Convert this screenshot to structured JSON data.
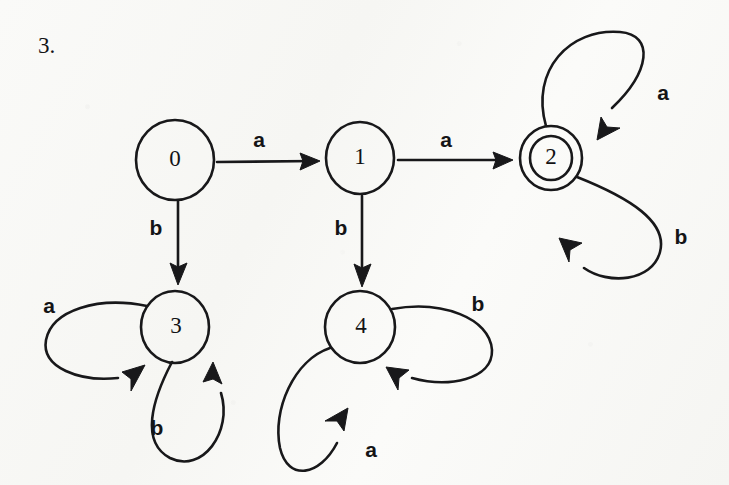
{
  "page": {
    "question_number": "3.",
    "background_color": "#f8f8f6",
    "ink_color": "#18181a"
  },
  "diagram": {
    "type": "finite-state-automaton",
    "alphabet": [
      "a",
      "b"
    ],
    "start_state": "0",
    "accepting_states": [
      "2"
    ],
    "states": [
      {
        "id": "0",
        "label": "0",
        "x": 175,
        "y": 160,
        "r": 38,
        "accepting": false
      },
      {
        "id": "1",
        "label": "1",
        "x": 360,
        "y": 158,
        "r": 34,
        "accepting": false
      },
      {
        "id": "2",
        "label": "2",
        "x": 551,
        "y": 158,
        "r": 31,
        "inner_r": 20,
        "accepting": true
      },
      {
        "id": "3",
        "label": "3",
        "x": 175,
        "y": 327,
        "r": 34,
        "accepting": false
      },
      {
        "id": "4",
        "label": "4",
        "x": 360,
        "y": 327,
        "r": 34,
        "accepting": false
      }
    ],
    "transitions": [
      {
        "from": "0",
        "to": "1",
        "label": "a",
        "label_x": 259,
        "label_y": 141,
        "kind": "straight"
      },
      {
        "from": "1",
        "to": "2",
        "label": "a",
        "label_x": 446,
        "label_y": 141,
        "kind": "straight"
      },
      {
        "from": "0",
        "to": "3",
        "label": "b",
        "label_x": 156,
        "label_y": 229,
        "kind": "straight"
      },
      {
        "from": "1",
        "to": "4",
        "label": "b",
        "label_x": 341,
        "label_y": 229,
        "kind": "straight"
      },
      {
        "from": "2",
        "to": "2",
        "label": "a",
        "label_x": 663,
        "label_y": 94,
        "kind": "self-loop"
      },
      {
        "from": "2",
        "to": "2",
        "label": "b",
        "label_x": 681,
        "label_y": 238,
        "kind": "self-loop"
      },
      {
        "from": "3",
        "to": "3",
        "label": "a",
        "label_x": 49,
        "label_y": 307,
        "kind": "self-loop"
      },
      {
        "from": "3",
        "to": "3",
        "label": "b",
        "label_x": 157,
        "label_y": 429,
        "kind": "self-loop"
      },
      {
        "from": "4",
        "to": "4",
        "label": "b",
        "label_x": 478,
        "label_y": 305,
        "kind": "self-loop"
      },
      {
        "from": "4",
        "to": "4",
        "label": "a",
        "label_x": 371,
        "label_y": 451,
        "kind": "self-loop"
      }
    ]
  }
}
